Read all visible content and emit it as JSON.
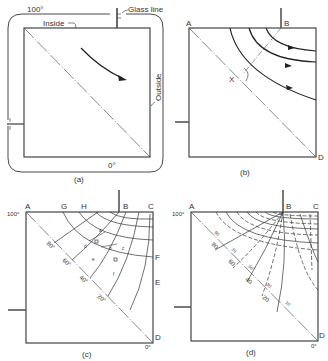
{
  "figure": {
    "panels": [
      {
        "id": "a",
        "caption": "(a)",
        "labels": {
          "top_temp": "100°",
          "bottom_temp": "0°",
          "inside": "Inside",
          "outside": "Outside",
          "glass_line": "Glass line"
        }
      },
      {
        "id": "b",
        "caption": "(b)",
        "labels": {
          "A": "A",
          "B": "B",
          "D": "D",
          "X": "X"
        }
      },
      {
        "id": "c",
        "caption": "(c)",
        "labels": {
          "A": "A",
          "G": "G",
          "H": "H",
          "B": "B",
          "C": "C",
          "F": "F",
          "E": "E",
          "D": "D",
          "top_temp": "100°",
          "bottom_temp": "0°"
        },
        "isotherm_labels": [
          "80°",
          "60°",
          "40°",
          "20°"
        ],
        "cell_labels": {
          "a": "a",
          "b": "b",
          "c": "c",
          "d": "d",
          "e": "e",
          "f": "f"
        },
        "dimension_labels": [
          "Δx",
          "Δy",
          "Δx",
          "Δy"
        ]
      },
      {
        "id": "d",
        "caption": "(d)",
        "labels": {
          "A": "A",
          "B": "B",
          "C": "C",
          "D": "D",
          "top_temp": "100°",
          "bottom_temp": "0°"
        },
        "isotherm_labels": [
          "90",
          "80",
          "70",
          "60",
          "50",
          "40",
          "30",
          "20",
          "10"
        ]
      }
    ],
    "colors": {
      "line": "#333333",
      "background": "#ffffff",
      "stem": "#555555"
    }
  }
}
